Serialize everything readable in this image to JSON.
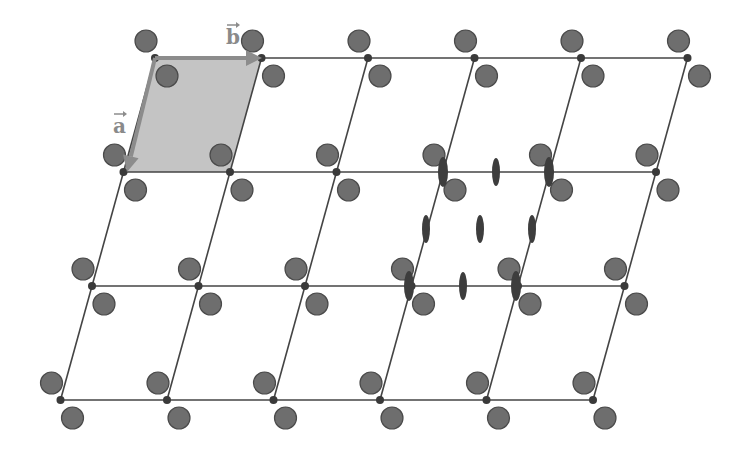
{
  "diagram": {
    "colors": {
      "background": "#ffffff",
      "lattice_line": "#444444",
      "lattice_point": "#3a3a3a",
      "atom_fill": "#6e6e6e",
      "atom_stroke": "#4a4a4a",
      "unit_cell_fill": "#c4c4c4",
      "unit_cell_edge": "#8c8c8c",
      "vector_color": "#8c8c8c",
      "symmetry_fill": "#3d3d3d"
    },
    "lattice": {
      "origin": [
        155,
        58
      ],
      "a_vector": [
        -31.5,
        114
      ],
      "b_vector": [
        106.5,
        0
      ],
      "rows": 4,
      "cols": 6
    },
    "basis_atoms": [
      {
        "name": "atom-upper-left",
        "offset": [
          -9,
          -17
        ],
        "radius": 11
      },
      {
        "name": "atom-lower-right",
        "offset": [
          12,
          18
        ],
        "radius": 11
      }
    ],
    "unit_cell": {
      "row": 0,
      "col": 0
    },
    "vectors": [
      {
        "name": "a",
        "label": "a",
        "from": [
          155,
          58
        ],
        "to": [
          127,
          172
        ],
        "label_pos": [
          113,
          133
        ]
      },
      {
        "name": "b",
        "label": "b",
        "from": [
          155,
          58
        ],
        "to": [
          262,
          58
        ],
        "label_pos": [
          226,
          44
        ]
      }
    ],
    "twofold_axes": [
      {
        "x": 443,
        "y": 172,
        "rx": 5,
        "ry": 15
      },
      {
        "x": 496,
        "y": 172,
        "rx": 4,
        "ry": 14
      },
      {
        "x": 549,
        "y": 172,
        "rx": 5,
        "ry": 15
      },
      {
        "x": 426,
        "y": 229,
        "rx": 4,
        "ry": 14
      },
      {
        "x": 480,
        "y": 229,
        "rx": 4,
        "ry": 14
      },
      {
        "x": 532,
        "y": 229,
        "rx": 4,
        "ry": 14
      },
      {
        "x": 409,
        "y": 286,
        "rx": 5,
        "ry": 15
      },
      {
        "x": 463,
        "y": 286,
        "rx": 4,
        "ry": 14
      },
      {
        "x": 516,
        "y": 286,
        "rx": 5,
        "ry": 15
      }
    ]
  }
}
